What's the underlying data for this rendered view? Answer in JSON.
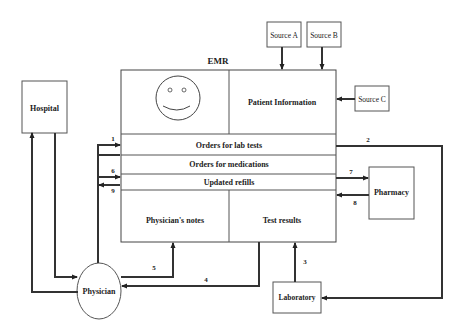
{
  "diagram": {
    "emr": {
      "title": "EMR",
      "sections": {
        "patient_information": "Patient Information",
        "orders_lab_tests": "Orders for lab tests",
        "orders_medications": "Orders for medications",
        "updated_refills": "Updated refills",
        "physicians_notes": "Physician's notes",
        "test_results": "Test results"
      },
      "icon": "smiley-face-icon"
    },
    "nodes": {
      "hospital": "Hospital",
      "physician": "Physician",
      "pharmacy": "Pharmacy",
      "laboratory": "Laboratory",
      "source_a": "Source A",
      "source_b": "Source B",
      "source_c": "Source C"
    },
    "flow_labels": {
      "f1": "1",
      "f2": "2",
      "f3": "3",
      "f4": "4",
      "f5": "5",
      "f6": "6",
      "f7": "7",
      "f8": "8",
      "f9": "9"
    },
    "edges": [
      {
        "from": "Source A",
        "to": "Patient Information"
      },
      {
        "from": "Source B",
        "to": "Patient Information"
      },
      {
        "from": "Source C",
        "to": "Patient Information"
      },
      {
        "from": "Physician",
        "to": "Orders for lab tests",
        "label": "1"
      },
      {
        "from": "Orders for lab tests",
        "to": "Laboratory",
        "label": "2"
      },
      {
        "from": "Laboratory",
        "to": "Test results",
        "label": "3"
      },
      {
        "from": "Test results",
        "to": "Physician",
        "label": "4"
      },
      {
        "from": "Physician",
        "to": "Physician's notes",
        "label": "5"
      },
      {
        "from": "Physician",
        "to": "Orders for medications",
        "label": "6"
      },
      {
        "from": "Orders for medications",
        "to": "Pharmacy",
        "label": "7"
      },
      {
        "from": "Pharmacy",
        "to": "Updated refills",
        "label": "8"
      },
      {
        "from": "Updated refills",
        "to": "Physician",
        "label": "9"
      },
      {
        "from": "Physician",
        "to": "Hospital"
      },
      {
        "from": "Hospital",
        "to": "Physician"
      }
    ]
  }
}
